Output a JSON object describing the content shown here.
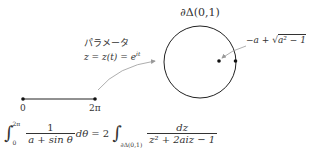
{
  "diagram": {
    "circle_label": "∂Δ(0,1)",
    "param_title": "パラメータ",
    "param_formula": "z = z(t) = e",
    "param_exponent": "it",
    "point_label_prefix": "−a + ",
    "point_label_sqrt": "√",
    "point_label_radicand": "a² − 1",
    "segment_start_label": "0",
    "segment_end_label": "2π",
    "equation": {
      "lhs_upper": "2π",
      "lhs_lower": "0",
      "lhs_num": "1",
      "lhs_den": "a + sin θ",
      "lhs_diff": "dθ",
      "equals": "= 2",
      "rhs_lower": "∂Δ(0,1)",
      "rhs_num": "dz",
      "rhs_den": "z² + 2aiz − 1"
    },
    "colors": {
      "stroke": "#222222",
      "arrow": "#999999",
      "text": "#333333"
    }
  }
}
